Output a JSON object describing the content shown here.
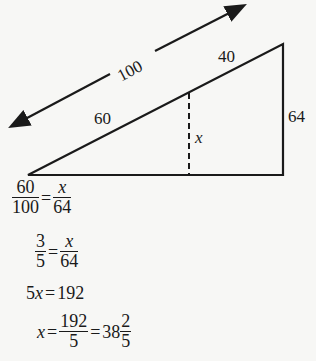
{
  "diagram": {
    "labels": {
      "total_hyp": "100",
      "upper_seg": "40",
      "lower_seg": "60",
      "height_big": "64",
      "height_small": "x"
    }
  },
  "solution": {
    "line1": {
      "l_num": "60",
      "l_den": "100",
      "eq": "=",
      "r_num": "x",
      "r_den": "64"
    },
    "line2": {
      "l_num": "3",
      "l_den": "5",
      "eq": "=",
      "r_num": "x",
      "r_den": "64"
    },
    "line3": {
      "lhs": "5x",
      "eq": "=",
      "rhs": "192"
    },
    "line4": {
      "lhs": "x",
      "eq1": "=",
      "f_num": "192",
      "f_den": "5",
      "eq2": "=",
      "whole": "38",
      "m_num": "2",
      "m_den": "5"
    }
  }
}
